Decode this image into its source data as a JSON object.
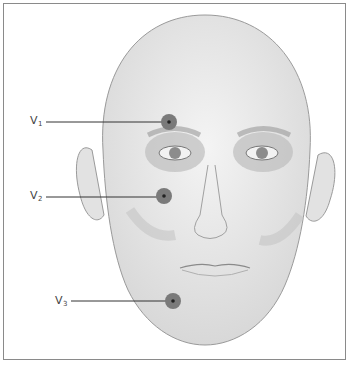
{
  "figure": {
    "labels": [
      {
        "id": "V1",
        "letter": "V",
        "sub": "1",
        "x": 30,
        "y": 114,
        "point": [
          169,
          122
        ],
        "line_start": 46
      },
      {
        "id": "V2",
        "letter": "V",
        "sub": "2",
        "x": 30,
        "y": 189,
        "point": [
          164,
          196
        ],
        "line_start": 46
      },
      {
        "id": "V3",
        "letter": "V",
        "sub": "3",
        "x": 55,
        "y": 294,
        "point": [
          173,
          301
        ],
        "line_start": 71
      }
    ],
    "colors": {
      "frame": "#8a8a8a",
      "dot": "#7a7a7a",
      "dot_center": "#222222",
      "skin": "#e6e6e6",
      "outline": "#9a9a9a"
    }
  }
}
